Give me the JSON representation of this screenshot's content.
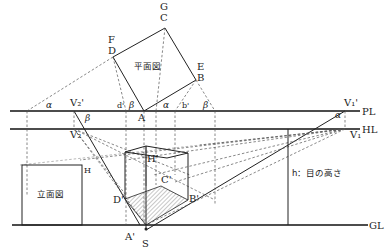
{
  "diagram": {
    "type": "two-point perspective construction",
    "plan_label": "平面図",
    "elevation_label": "立面図",
    "eye_height_label": "h：目の高さ",
    "lines": {
      "picture_line": "PL",
      "horizon_line": "HL",
      "ground_line": "GL"
    },
    "plan_points": {
      "G": "G",
      "C": "C",
      "F": "F",
      "D": "D",
      "E": "E",
      "B": "B",
      "A": "A"
    },
    "picture_plane_points": {
      "d": "d'",
      "b": "b'"
    },
    "vanishing_points": {
      "v2_top": "V₂'",
      "v2_bottom": "V₂",
      "v1_top": "V₁'",
      "v1_bottom": "V₁"
    },
    "perspective_points": {
      "H_prime": "H'",
      "C_prime": "C'",
      "D_prime": "D'",
      "B_prime": "B'",
      "A_prime": "A'",
      "S": "S"
    },
    "elevation_points": {
      "H": "H"
    },
    "angles": {
      "alpha": "α",
      "beta": "β"
    }
  }
}
